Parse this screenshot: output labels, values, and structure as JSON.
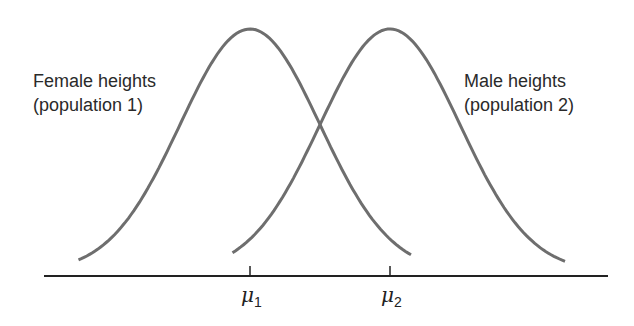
{
  "chart_data": {
    "type": "line",
    "title": "",
    "series": [
      {
        "name": "Female heights (population 1)",
        "mean_label": "μ1",
        "mean": 0,
        "sd": 1,
        "x_range": [
          -2.45,
          2.3
        ]
      },
      {
        "name": "Male heights (population 2)",
        "mean_label": "μ2",
        "mean": 2,
        "sd": 1,
        "x_range": [
          -0.25,
          4.5
        ]
      }
    ],
    "x_domain": [
      -3.0,
      5.2
    ],
    "grid": false,
    "color": "#6e6e6e"
  },
  "labels": {
    "pop1_line1": "Female heights",
    "pop1_line2": "(population 1)",
    "pop2_line1": "Male heights",
    "pop2_line2": "(population 2)",
    "mu1_sym": "μ",
    "mu1_sub": "1",
    "mu2_sym": "μ",
    "mu2_sub": "2"
  }
}
